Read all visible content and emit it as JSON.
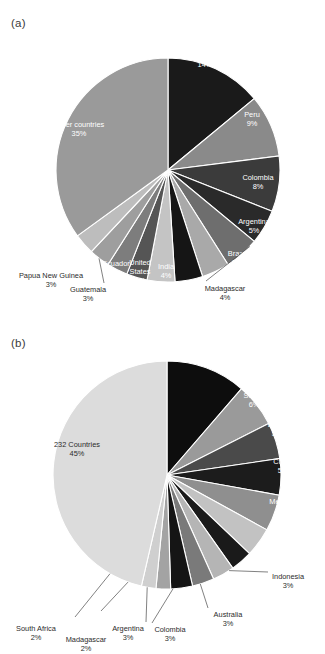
{
  "figure": {
    "panels": [
      {
        "letter": "(a)"
      },
      {
        "letter": "(b)"
      }
    ]
  },
  "chart_data": [
    {
      "type": "pie",
      "panel": "(a)",
      "title": "",
      "legend": "none",
      "start_angle_deg": 0,
      "direction": "clockwise",
      "categories": [
        "Mexico",
        "Peru",
        "Colombia",
        "Argentina",
        "Brazil",
        "Madagascar",
        "India",
        "United States",
        "Ecuador",
        "Guatemala",
        "Papua New Guinea",
        "Cuba",
        "Other countries"
      ],
      "values": [
        14,
        9,
        8,
        5,
        5,
        4,
        4,
        4,
        3,
        3,
        3,
        3,
        35
      ],
      "value_labels": [
        "14%",
        "9%",
        "8%",
        "5%",
        "5%",
        "4%",
        "4%",
        "4%",
        "3%",
        "3%",
        "3%",
        "3%",
        "35%"
      ],
      "colors": [
        "#1a1a1a",
        "#8a8a8a",
        "#3b3b3b",
        "#2a2a2a",
        "#6e6e6e",
        "#a9a9a9",
        "#151515",
        "#c4c4c4",
        "#555555",
        "#7d7d7d",
        "#9e9e9e",
        "#bdbdbd",
        "#9a9a9a"
      ],
      "label_placement": [
        "inside",
        "inside",
        "inside",
        "inside",
        "inside",
        "outside",
        "inside",
        "inside",
        "inside",
        "outside",
        "outside",
        "inside",
        "inside"
      ]
    },
    {
      "type": "pie",
      "panel": "(b)",
      "title": "",
      "legend": "none",
      "start_angle_deg": 0,
      "direction": "clockwise",
      "categories": [
        "Russia",
        "United States",
        "Brazil",
        "China",
        "Mexico",
        "India",
        "Indonesia",
        "Australia",
        "Colombia",
        "Argentina",
        "Madagascar",
        "South Africa",
        "232 Countries"
      ],
      "values": [
        11,
        6,
        5,
        5,
        5,
        4,
        3,
        3,
        3,
        3,
        2,
        2,
        45
      ],
      "value_labels": [
        "11%",
        "6%",
        "5%",
        "5%",
        "5%",
        "4%",
        "3%",
        "3%",
        "3%",
        "3%",
        "2%",
        "2%",
        "45%"
      ],
      "colors": [
        "#0d0d0d",
        "#9a9a9a",
        "#4a4a4a",
        "#1c1c1c",
        "#8f8f8f",
        "#c2c2c2",
        "#1a1a1a",
        "#b5b5b5",
        "#7a7a7a",
        "#151515",
        "#a3a3a3",
        "#cfcfcf",
        "#dcdcdc"
      ],
      "label_placement": [
        "inside",
        "inside",
        "inside",
        "inside",
        "inside",
        "inside",
        "outside",
        "outside",
        "outside",
        "outside",
        "outside",
        "outside",
        "inside"
      ]
    }
  ]
}
